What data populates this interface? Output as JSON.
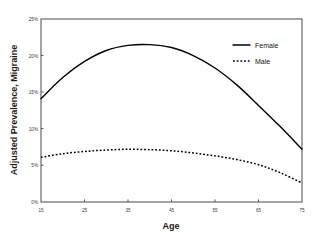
{
  "chart_data": {
    "type": "line",
    "title": "",
    "xlabel": "Age",
    "ylabel": "Adjusted Prevalence, Migraine",
    "xlim": [
      15,
      75
    ],
    "ylim": [
      0,
      25
    ],
    "xticks": [
      15,
      25,
      35,
      45,
      55,
      65,
      75
    ],
    "xtick_labels": [
      "15",
      "25",
      "35",
      "45",
      "55",
      "65",
      "75"
    ],
    "yticks": [
      0,
      5,
      10,
      15,
      20,
      25
    ],
    "ytick_labels": [
      "0%",
      "5%",
      "10%",
      "15%",
      "20%",
      "25%"
    ],
    "grid": false,
    "legend_position": "top-right-inside",
    "x": [
      15,
      20,
      25,
      30,
      35,
      40,
      45,
      50,
      55,
      60,
      65,
      70,
      75
    ],
    "series": [
      {
        "name": "Female",
        "style": "solid",
        "color": "#000000",
        "values": [
          14.1,
          17.0,
          19.2,
          20.7,
          21.4,
          21.5,
          21.1,
          20.0,
          18.3,
          16.0,
          13.2,
          10.3,
          7.2
        ]
      },
      {
        "name": "Male",
        "style": "dotted",
        "color": "#000000",
        "values": [
          6.1,
          6.6,
          6.9,
          7.1,
          7.2,
          7.15,
          7.0,
          6.7,
          6.3,
          5.8,
          5.1,
          4.0,
          2.6
        ]
      }
    ]
  },
  "legend": {
    "entries": [
      {
        "label": "Female",
        "style": "solid"
      },
      {
        "label": "Male",
        "style": "dotted"
      }
    ]
  }
}
